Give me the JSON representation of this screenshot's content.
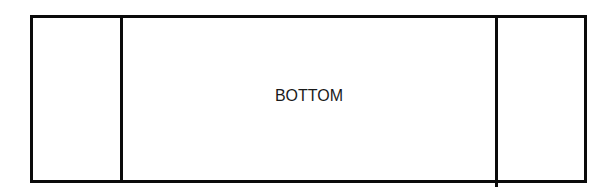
{
  "diagram": {
    "type": "three-panel-layout",
    "stroke_color": "#0a0a0a",
    "background_color": "#ffffff",
    "panels": [
      {
        "id": "left",
        "label": ""
      },
      {
        "id": "center",
        "label": "BOTTOM"
      },
      {
        "id": "right",
        "label": ""
      }
    ]
  }
}
